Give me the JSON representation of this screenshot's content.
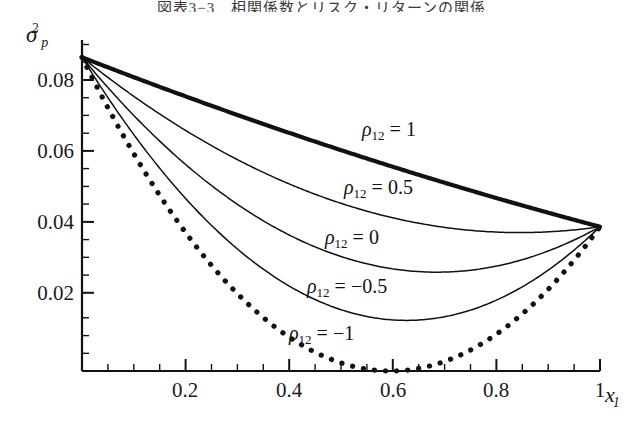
{
  "caption": "図表3−3　相関係数とリスク・リターンの関係",
  "axes": {
    "y_label": "σ",
    "y_label_sub": "p",
    "y_label_sup": "2",
    "x_label": "x",
    "x_label_sub": "1",
    "y_ticks": [
      "0.02",
      "0.04",
      "0.06",
      "0.08"
    ],
    "x_ticks": [
      "0.2",
      "0.4",
      "0.6",
      "0.8",
      "1"
    ]
  },
  "curve_labels": [
    {
      "name": "rho-1",
      "rho": "ρ",
      "sub": "12",
      "eq": " = 1"
    },
    {
      "name": "rho-0.5",
      "rho": "ρ",
      "sub": "12",
      "eq": " = 0.5"
    },
    {
      "name": "rho-0",
      "rho": "ρ",
      "sub": "12",
      "eq": " = 0"
    },
    {
      "name": "rho-neg05",
      "rho": "ρ",
      "sub": "12",
      "eq": " = −0.5"
    },
    {
      "name": "rho-neg1",
      "rho": "ρ",
      "sub": "12",
      "eq": " = −1"
    }
  ],
  "chart_data": {
    "type": "line",
    "title": "図表3−3　相関係数とリスク・リターンの関係",
    "xlabel": "x_1",
    "ylabel": "sigma_p^2",
    "xlim": [
      0,
      1.0
    ],
    "ylim": [
      0,
      0.0975
    ],
    "grid": false,
    "legend": "inline-annotations",
    "x_ticks": [
      0.2,
      0.4,
      0.6,
      0.8,
      1.0
    ],
    "y_ticks": [
      0.02,
      0.04,
      0.06,
      0.08
    ],
    "x_minor_step": 0.05,
    "y_minor_step": 0.005,
    "model": "sigma_p^2 = x1^2*s1sq + (1-x1)^2*s2sq + 2*x1*(1-x1)*rho*sqrt(s1sq*s2sq)",
    "endpoint_at_x0": 0.0425,
    "endpoint_at_x1": 0.0924,
    "sigma1_sq": 0.0924,
    "sigma2_sq": 0.0425,
    "note": "x1 is weight of asset 1; at x1=0 variance = 0.0425, at x1=1 variance = 0.0924 (curves drawn from upper-left to lower-right in plotted orientation)",
    "series": [
      {
        "name": "rho_12 = 1",
        "rho": 1,
        "style": "solid-thick",
        "x": [
          0.0,
          0.1,
          0.2,
          0.3,
          0.4,
          0.5,
          0.6,
          0.7,
          0.8,
          0.9,
          1.0
        ],
        "y": [
          0.0924,
          0.0873,
          0.0824,
          0.0775,
          0.0728,
          0.0682,
          0.0637,
          0.0593,
          0.0551,
          0.0509,
          0.0425
        ]
      },
      {
        "name": "rho_12 = 0.5",
        "rho": 0.5,
        "style": "solid-thin",
        "x": [
          0.0,
          0.1,
          0.2,
          0.3,
          0.4,
          0.5,
          0.6,
          0.7,
          0.8,
          0.9,
          1.0
        ],
        "y": [
          0.0924,
          0.0842,
          0.0766,
          0.0697,
          0.0634,
          0.0578,
          0.0528,
          0.0485,
          0.0448,
          0.0418,
          0.0425
        ]
      },
      {
        "name": "rho_12 = 0",
        "rho": 0,
        "style": "solid-thin",
        "x": [
          0.0,
          0.1,
          0.2,
          0.3,
          0.4,
          0.5,
          0.6,
          0.7,
          0.8,
          0.9,
          1.0
        ],
        "y": [
          0.0924,
          0.0811,
          0.0707,
          0.0612,
          0.0527,
          0.0451,
          0.0384,
          0.0327,
          0.0279,
          0.024,
          0.0425
        ]
      },
      {
        "name": "rho_12 = -0.5",
        "rho": -0.5,
        "style": "solid-thin",
        "x": [
          0.0,
          0.1,
          0.2,
          0.3,
          0.4,
          0.5,
          0.6,
          0.7,
          0.8,
          0.9,
          1.0
        ],
        "y": [
          0.0924,
          0.078,
          0.0649,
          0.053,
          0.0423,
          0.0328,
          0.0246,
          0.0175,
          0.0117,
          0.007,
          0.0425
        ]
      },
      {
        "name": "rho_12 = -1",
        "rho": -1,
        "style": "dotted-thick",
        "x": [
          0.0,
          0.1,
          0.2,
          0.3,
          0.4,
          0.5,
          0.58,
          0.6,
          0.7,
          0.8,
          0.9,
          1.0
        ],
        "y": [
          0.0924,
          0.0749,
          0.059,
          0.0448,
          0.0322,
          0.0212,
          0.0,
          0.0013,
          0.0062,
          0.0141,
          0.0233,
          0.0425
        ]
      }
    ]
  }
}
